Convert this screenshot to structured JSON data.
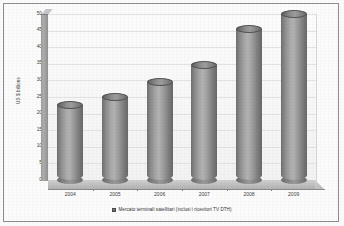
{
  "chart_data": {
    "type": "bar",
    "title": "",
    "subtitle": "",
    "xlabel": "",
    "ylabel": "US $ billions",
    "categories": [
      "2004",
      "2005",
      "2006",
      "2007",
      "2008",
      "2009"
    ],
    "values": [
      22.5,
      25.0,
      29.5,
      34.5,
      45.5,
      50.0
    ],
    "series": [
      {
        "name": "Mercato terminali satellitari (inclusi i ricevitori TV DTH)",
        "values": [
          22.5,
          25.0,
          29.5,
          34.5,
          45.5,
          50.0
        ]
      }
    ],
    "ylim": [
      0,
      50
    ],
    "y_ticks": [
      0,
      5,
      10,
      15,
      20,
      25,
      30,
      35,
      40,
      45,
      50
    ],
    "y_tick_labels": [
      "0",
      "5",
      "10",
      "15",
      "20",
      "25",
      "30",
      "35",
      "40",
      "45",
      "50"
    ],
    "grid": true,
    "legend_position": "bottom",
    "style": "3d-cylinder",
    "colors": {
      "bar": "#8e8e8e",
      "bar_dark": "#5f5f5f",
      "plot_background": "#f8f8f8",
      "gridline": "#e2e2e2",
      "axis": "#6f6f6f",
      "text": "#3d3d3d",
      "frame": "#8d8d8d"
    }
  },
  "legend": {
    "swatch_name": "legend-color-swatch",
    "label": "Mercato terminali satellitari (inclusi i ricevitori TV DTH)"
  },
  "axes": {
    "y_title": "US $ billions"
  }
}
